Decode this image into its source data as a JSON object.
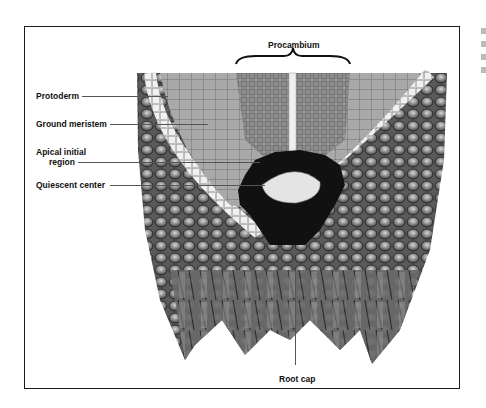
{
  "figure": {
    "labels": {
      "procambium": "Procambium",
      "protoderm": "Protoderm",
      "ground_meristem": "Ground meristem",
      "apical_initial_line1": "Apical initial",
      "apical_initial_line2": "region",
      "quiescent_center": "Quiescent center",
      "root_cap": "Root cap"
    },
    "colors": {
      "frame": "#1a1a1a",
      "meristem_fill": "#a9a9a9",
      "procambium_fill": "#9a9a9a",
      "protoderm_band": "#e8e8e8",
      "apical_region": "#111111",
      "quiescent_center": "#e6e6e6",
      "root_cap_cells": "#6e6e6e",
      "cell_walls": "#2a2a2a"
    }
  }
}
